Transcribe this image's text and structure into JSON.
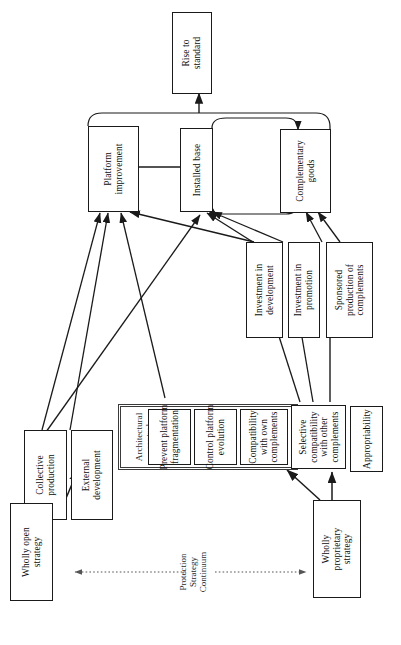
{
  "diagram": {
    "orientation": "rotated-90",
    "nodes": {
      "rise_to_standard": "Rise to\nstandard",
      "platform_improvement": "Platform\nimprovement",
      "installed_base": "Installed base",
      "complementary_goods": "Complementary\ngoods",
      "investment_development": "Investment in\ndevelopment",
      "investment_promotion": "Investment in\npromotion",
      "sponsored_production": "Sponsored\nproduction of\ncomplements",
      "collective_production": "Collective\nproduction",
      "external_development": "External\ndevelopment",
      "architectural_control": "Architectural\ncontrol",
      "prevent_fragmentation": "Prevent platform\nfragmentation",
      "control_platform_evolution": "Control platform\nevolution",
      "compatibility_own": "Compatibility\nwith own\ncomplements",
      "selective_compatibility_other": "Selective\ncompatibility\nwith other\ncomplements",
      "appropriability": "Appropriability",
      "wholly_open_strategy": "Wholly open\nstrategy",
      "wholly_proprietary_strategy": "Wholly\nproprietary\nstrategy"
    },
    "axis_label": "Protection\nStrategy\nContinuum",
    "colors": {
      "stroke": "#1a1a1a",
      "background": "#ffffff",
      "group_stroke": "#3a3a3a",
      "axis_stroke": "#555555"
    }
  }
}
